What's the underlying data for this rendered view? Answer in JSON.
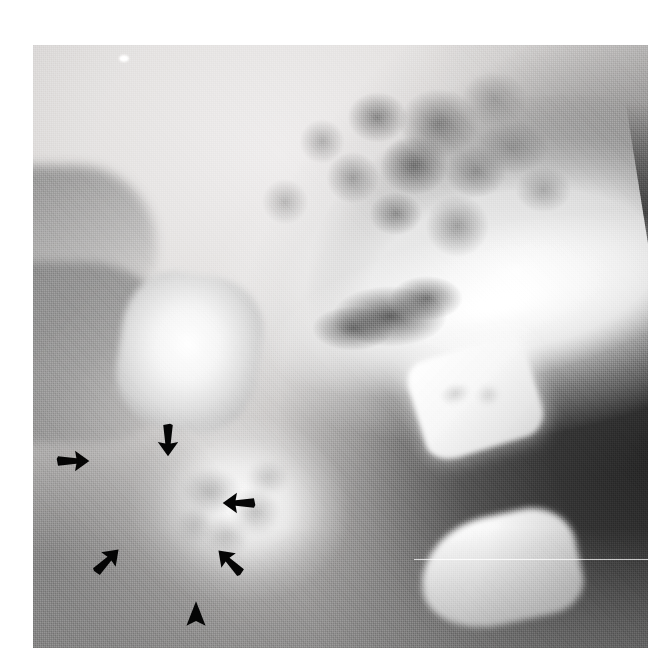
{
  "figure": {
    "kind": "radiograph",
    "modality": "plain-film-radiograph",
    "projection": "lateral",
    "region": "craniocervical junction / upper cervical spine",
    "caption": "",
    "background_color": "#ffffff",
    "plate": {
      "left": 33,
      "top": 45,
      "width": 615,
      "height": 603,
      "film_tone_light": "#ececea",
      "film_tone_mid": "#b9b9b9",
      "film_tone_dark": "#2e2e2e"
    },
    "artifacts": [
      {
        "name": "scan-line",
        "description": "thin bright horizontal line across right half",
        "y_percent": 85.2
      },
      {
        "name": "emulsion-speck",
        "description": "small white speck near top-left of film",
        "x_percent": 14,
        "y_percent": 1.6
      }
    ],
    "anatomy": [
      {
        "name": "occipital-skull-base",
        "tone": "bright",
        "position": "upper-right"
      },
      {
        "name": "mastoid-air-cells",
        "tone": "mottled",
        "position": "upper-middle"
      },
      {
        "name": "posterior-arch-c1",
        "tone": "bright",
        "position": "middle-right"
      },
      {
        "name": "lateral-mass",
        "tone": "bright",
        "position": "middle-left"
      },
      {
        "name": "dens-odontoid-process",
        "tone": "bright-with-lucency",
        "position": "lower-centre"
      },
      {
        "name": "c2-posterior-element",
        "tone": "bright",
        "position": "lower-right"
      },
      {
        "name": "airway-soft-tissue",
        "tone": "dark",
        "position": "right"
      }
    ],
    "markers": [
      {
        "id": "arrow-top",
        "label": "arrow",
        "shape": "arrow",
        "direction": "down",
        "x_percent": 22.0,
        "y_percent": 65.5,
        "size": 34,
        "color": "#0a0a0a"
      },
      {
        "id": "arrow-left",
        "label": "arrow",
        "shape": "arrow",
        "direction": "right",
        "x_percent": 6.5,
        "y_percent": 69.0,
        "size": 34,
        "color": "#0a0a0a"
      },
      {
        "id": "arrow-right-mid",
        "label": "arrow",
        "shape": "arrow",
        "direction": "left",
        "x_percent": 33.5,
        "y_percent": 76.0,
        "size": 34,
        "color": "#0a0a0a"
      },
      {
        "id": "arrow-lower-left",
        "label": "arrow",
        "shape": "arrow",
        "direction": "up-right",
        "x_percent": 12.0,
        "y_percent": 85.5,
        "size": 34,
        "color": "#0a0a0a"
      },
      {
        "id": "arrow-lower-right",
        "label": "arrow",
        "shape": "arrow",
        "direction": "up-left",
        "x_percent": 32.0,
        "y_percent": 85.8,
        "size": 34,
        "color": "#0a0a0a"
      },
      {
        "id": "arrowhead-bottom",
        "label": "arrowhead",
        "shape": "arrowhead",
        "direction": "up",
        "x_percent": 26.5,
        "y_percent": 94.5,
        "size": 30,
        "color": "#0a0a0a"
      }
    ],
    "marker_counts": {
      "arrows": 5,
      "arrowheads": 1
    }
  }
}
